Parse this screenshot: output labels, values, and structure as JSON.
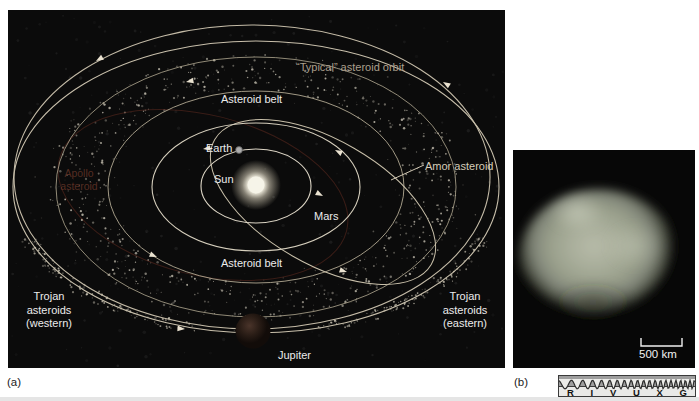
{
  "figure": {
    "panel_a_tag": "(a)",
    "panel_b_tag": "(b)"
  },
  "panel_a": {
    "labels": {
      "typical_orbit": "“Typical” asteroid orbit",
      "asteroid_belt_top": "Asteroid belt",
      "asteroid_belt_bottom": "Asteroid belt",
      "earth": "Earth",
      "sun": "Sun",
      "mars": "Mars",
      "amor": "Amor asteroid",
      "apollo_line1": "Apollo",
      "apollo_line2": "asteroid",
      "trojan_west": [
        "Trojan",
        "asteroids",
        "(western)"
      ],
      "trojan_east": [
        "Trojan",
        "asteroids",
        "(eastern)"
      ],
      "jupiter": "Jupiter"
    }
  },
  "panel_b": {
    "scale_label": "500 km",
    "spectrum_letters": [
      "R",
      "I",
      "V",
      "U",
      "X",
      "G"
    ]
  },
  "colors": {
    "panel_background": "#0b0b0b",
    "orbit_line": "#cfc6b2",
    "label_text": "#ececec",
    "typical_label_text": "#ab9f8c",
    "apollo_label_text": "#b05a42",
    "asteroid_photo_tint": "#9aa08c",
    "page_background": "#ffffff"
  }
}
